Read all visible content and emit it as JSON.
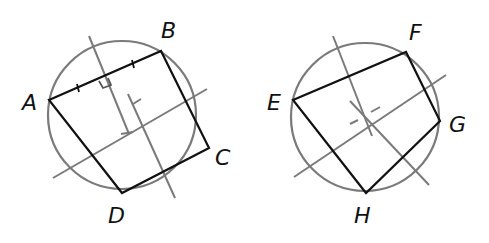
{
  "figures": [
    {
      "id": "left",
      "circle": {
        "cx": 122,
        "cy": 115,
        "r": 74
      },
      "polygon_points": "49,100 161,51 209,148 122,193",
      "vertices": [
        {
          "name": "A",
          "x": 49,
          "y": 100,
          "label_x": 22,
          "label_y": 110
        },
        {
          "name": "B",
          "x": 161,
          "y": 51,
          "label_x": 161,
          "label_y": 38
        },
        {
          "name": "C",
          "x": 209,
          "y": 148,
          "label_x": 215,
          "label_y": 165
        },
        {
          "name": "D",
          "x": 122,
          "y": 193,
          "label_x": 108,
          "label_y": 223
        }
      ],
      "lines": [
        {
          "x1": 89,
          "y1": 36,
          "x2": 129,
          "y2": 134
        },
        {
          "x1": 53,
          "y1": 178,
          "x2": 207,
          "y2": 89
        },
        {
          "x1": 128,
          "y1": 94,
          "x2": 175,
          "y2": 198
        }
      ],
      "ticks": [
        {
          "x1": 77,
          "y1": 84,
          "x2": 79,
          "y2": 92
        },
        {
          "x1": 132,
          "y1": 60,
          "x2": 134,
          "y2": 68
        },
        {
          "x1": 121,
          "y1": 134,
          "x2": 133,
          "y2": 132
        },
        {
          "x1": 133,
          "y1": 104,
          "x2": 141,
          "y2": 99
        }
      ],
      "right_angle_mark": "99,81 103,88 111,85 108,78"
    },
    {
      "id": "right",
      "circle": {
        "cx": 365,
        "cy": 117,
        "r": 74
      },
      "polygon_points": "293,100 406,52 440,121 366,193",
      "vertices": [
        {
          "name": "E",
          "x": 293,
          "y": 100,
          "label_x": 267,
          "label_y": 110
        },
        {
          "name": "F",
          "x": 406,
          "y": 52,
          "label_x": 409,
          "label_y": 40
        },
        {
          "name": "G",
          "x": 440,
          "y": 121,
          "label_x": 449,
          "label_y": 132
        },
        {
          "name": "H",
          "x": 366,
          "y": 193,
          "label_x": 354,
          "label_y": 223
        }
      ],
      "lines": [
        {
          "x1": 333,
          "y1": 36,
          "x2": 372,
          "y2": 136
        },
        {
          "x1": 294,
          "y1": 177,
          "x2": 446,
          "y2": 75
        },
        {
          "x1": 350,
          "y1": 101,
          "x2": 429,
          "y2": 185
        }
      ],
      "ticks": [
        {
          "x1": 350,
          "y1": 124,
          "x2": 358,
          "y2": 120
        },
        {
          "x1": 371,
          "y1": 112,
          "x2": 380,
          "y2": 107
        }
      ]
    }
  ]
}
